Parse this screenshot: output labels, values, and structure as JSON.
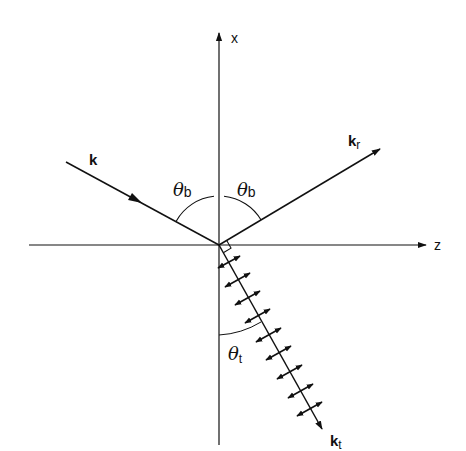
{
  "diagram": {
    "title": "",
    "axes": {
      "x_label": "x",
      "z_label": "z"
    },
    "vectors": {
      "incident": {
        "label": "k",
        "subscript": ""
      },
      "reflected": {
        "label": "k",
        "subscript": "r"
      },
      "transmitted": {
        "label": "k",
        "subscript": "t"
      }
    },
    "angles": {
      "incidence": {
        "symbol": "θ",
        "subscript": "b"
      },
      "reflection": {
        "symbol": "θ",
        "subscript": "b"
      },
      "transmission": {
        "symbol": "θ",
        "subscript": "t"
      }
    },
    "annotations": {
      "right_angle_marker": "right angle between reflected and transmitted wave vectors",
      "polarization_arrows_count": 9
    },
    "colors": {
      "ink": "#111111",
      "background": "#ffffff"
    }
  }
}
